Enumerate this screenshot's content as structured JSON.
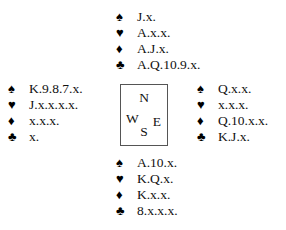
{
  "diagram": {
    "kind": "bridge-hand-diagram",
    "background_color": "#ffffff",
    "text_color": "#111111",
    "box_border_color": "#555555"
  },
  "suits": {
    "spade": "♠",
    "heart": "♥",
    "diamond": "♦",
    "club": "♣"
  },
  "compass": {
    "north": "N",
    "west": "W",
    "east": "E",
    "south": "S"
  },
  "hands": {
    "north": {
      "position": "North",
      "spades": "J.x.",
      "hearts": "A.x.x.",
      "diamonds": "A.J.x.",
      "clubs": "A.Q.10.9.x."
    },
    "west": {
      "position": "West",
      "spades": "K.9.8.7.x.",
      "hearts": "J.x.x.x.x.",
      "diamonds": "x.x.x.",
      "clubs": "x."
    },
    "east": {
      "position": "East",
      "spades": "Q.x.x.",
      "hearts": "x.x.x.",
      "diamonds": "Q.10.x.x.",
      "clubs": "K.J.x."
    },
    "south": {
      "position": "South",
      "spades": "A.10.x.",
      "hearts": "K.Q.x.",
      "diamonds": "K.x.x.",
      "clubs": "8.x.x.x."
    }
  }
}
